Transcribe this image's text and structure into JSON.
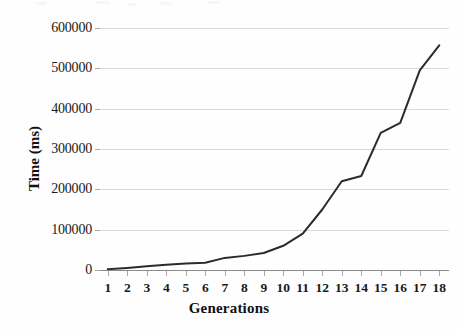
{
  "chart_data": {
    "type": "line",
    "title": "",
    "subtitle": "",
    "xlabel": "Generations",
    "ylabel": "Time (ms)",
    "categories": [
      "1",
      "2",
      "3",
      "4",
      "5",
      "6",
      "7",
      "8",
      "9",
      "10",
      "11",
      "12",
      "13",
      "14",
      "15",
      "16",
      "17",
      "18"
    ],
    "x": [
      1,
      2,
      3,
      4,
      5,
      6,
      7,
      8,
      9,
      10,
      11,
      12,
      13,
      14,
      15,
      16,
      17,
      18
    ],
    "values": [
      2000,
      5000,
      9000,
      13000,
      16000,
      18000,
      30000,
      35000,
      42000,
      60000,
      90000,
      150000,
      220000,
      233000,
      340000,
      365000,
      495000,
      557000
    ],
    "series": [
      {
        "name": "Time (ms)",
        "values": [
          2000,
          5000,
          9000,
          13000,
          16000,
          18000,
          30000,
          35000,
          42000,
          60000,
          90000,
          150000,
          220000,
          233000,
          340000,
          365000,
          495000,
          557000
        ]
      }
    ],
    "ylim": [
      0,
      600000
    ],
    "yticks": [
      0,
      100000,
      200000,
      300000,
      400000,
      500000,
      600000
    ],
    "ytick_labels": [
      "0",
      "100000",
      "200000",
      "300000",
      "400000",
      "500000",
      "600000"
    ],
    "xtick_labels": [
      "1",
      "2",
      "3",
      "4",
      "5",
      "6",
      "7",
      "8",
      "9",
      "10",
      "11",
      "12",
      "13",
      "14",
      "15",
      "16",
      "17",
      "18"
    ],
    "grid": "horizontal",
    "legend": "none",
    "markers": "none",
    "line_color": "#2b2b2b",
    "grid_color": "#d9d9d9",
    "axis_color": "#8c8c8c",
    "background_color": "#fefefe",
    "annotations": []
  }
}
